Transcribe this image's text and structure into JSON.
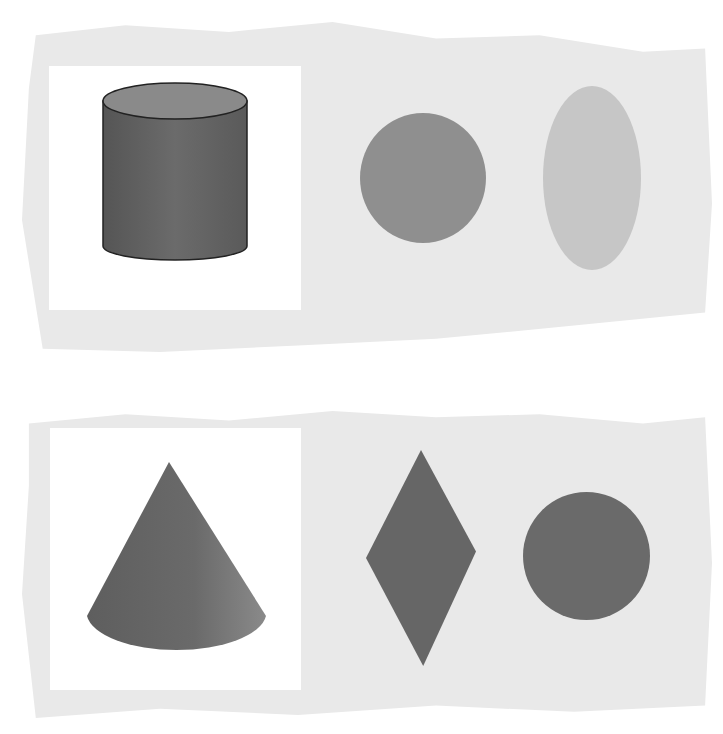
{
  "figure": {
    "colors": {
      "panel_bg": "#e9e9e9",
      "card_bg": "#ffffff",
      "dark_shape": "#6a6a6a",
      "medium_shape": "#8a8a8a",
      "light_shape": "#bdbdbd",
      "outline": "#222222"
    },
    "rows": [
      {
        "solid": "cylinder",
        "projections": [
          "circle",
          "ellipse"
        ]
      },
      {
        "solid": "cone",
        "projections": [
          "rhombus",
          "circle"
        ]
      }
    ]
  }
}
